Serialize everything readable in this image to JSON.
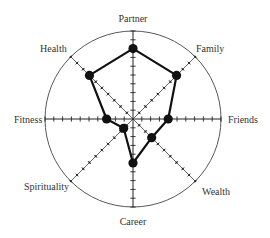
{
  "chart_data": {
    "type": "radar",
    "title": "",
    "axes": [
      "Partner",
      "Family",
      "Friends",
      "Wealth",
      "Career",
      "Spirituality",
      "Fitness",
      "Health"
    ],
    "series": [
      {
        "name": "Wheel of Life",
        "values": [
          8,
          7,
          4,
          3,
          5,
          1.5,
          3,
          7
        ]
      }
    ],
    "range": [
      0,
      10
    ],
    "ticks_per_axis": 10,
    "grid": "outer circle only",
    "legend": "none",
    "colors": {
      "line": "#111111",
      "axis": "#222222",
      "circle": "#444444",
      "label": "#333333"
    }
  },
  "geometry": {
    "cx": 133,
    "cy": 119,
    "r": 88
  }
}
